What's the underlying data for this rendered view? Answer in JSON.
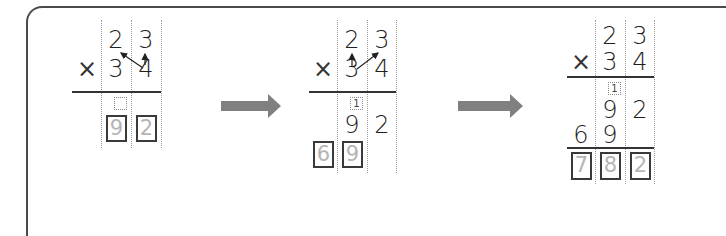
{
  "diagram": {
    "colors": {
      "frame": "#4a4a4a",
      "digit": "#1f1f1f",
      "answer_box_digit": "#b5b5b5",
      "arrow": "#808080"
    },
    "steps": [
      {
        "id": "step1",
        "multiplicand": [
          "2",
          "3"
        ],
        "operator": "×",
        "multiplier": [
          "3",
          "4"
        ],
        "carry": "",
        "answer_boxes": [
          "9",
          "2"
        ]
      },
      {
        "id": "step2",
        "multiplicand": [
          "2",
          "3"
        ],
        "operator": "×",
        "multiplier": [
          "3",
          "4"
        ],
        "carry": "1",
        "partial_1": [
          "9",
          "2"
        ],
        "answer_boxes": [
          "6",
          "9"
        ]
      },
      {
        "id": "step3",
        "multiplicand": [
          "2",
          "3"
        ],
        "operator": "×",
        "multiplier": [
          "3",
          "4"
        ],
        "carry": "1",
        "partial_1": [
          "9",
          "2"
        ],
        "partial_2": [
          "6",
          "9"
        ],
        "answer_boxes": [
          "7",
          "8",
          "2"
        ]
      }
    ],
    "transitions": [
      "arrow-right",
      "arrow-right"
    ]
  }
}
